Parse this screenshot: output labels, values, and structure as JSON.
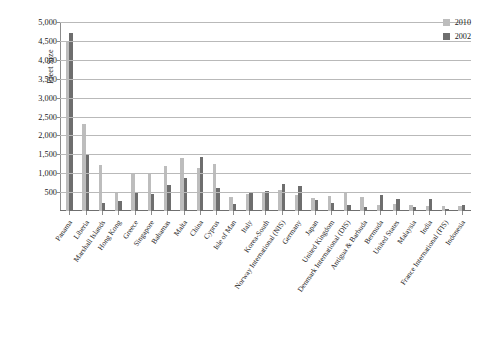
{
  "chart_data": {
    "type": "bar",
    "title": "",
    "xlabel": "",
    "ylabel": "Fleet Size",
    "ylim": [
      0,
      5000
    ],
    "ytick_step": 500,
    "ytick_labels": [
      "5,000",
      "4,500",
      "4,000",
      "3,500",
      "3,000",
      "2,500",
      "2,000",
      "1,500",
      "1,000",
      "500"
    ],
    "grid": true,
    "legend_position": "top-right",
    "colors": {
      "2010": "#bdbdbd",
      "2002": "#6e6e6e",
      "gridline": "#b9b9b9",
      "axis": "#8d8d8d"
    },
    "categories": [
      "Panama",
      "Liberia",
      "Marshall Islands",
      "Hong Kong",
      "Greece",
      "Singapore",
      "Bahamas",
      "Malta",
      "China",
      "Cyprus",
      "Isle of Man",
      "Italy",
      "Korea-South",
      "Norway International (NIS)",
      "Germany",
      "Japan",
      "United Kingdom",
      "Denmark International (DIS)",
      "Antigua & Barbuda",
      "Bermuda",
      "United States",
      "Malaysia",
      "India",
      "France International (FIS)",
      "Indonesia"
    ],
    "series": [
      {
        "name": "2010",
        "color": "#bdbdbd",
        "values": [
          4500,
          2300,
          1230,
          510,
          1000,
          980,
          1190,
          1400,
          1150,
          1250,
          380,
          460,
          480,
          560,
          420,
          350,
          390,
          480,
          360,
          160,
          175,
          155,
          140,
          130,
          140
        ]
      },
      {
        "name": "2002",
        "color": "#6e6e6e",
        "values": [
          4720,
          1500,
          225,
          270,
          500,
          440,
          680,
          880,
          1440,
          600,
          180,
          510,
          540,
          710,
          670,
          290,
          220,
          170,
          105,
          420,
          320,
          110,
          330,
          60,
          150
        ]
      }
    ],
    "legend": [
      {
        "label": "2010",
        "color": "#bdbdbd"
      },
      {
        "label": "2002",
        "color": "#6e6e6e"
      }
    ]
  },
  "caption": ""
}
